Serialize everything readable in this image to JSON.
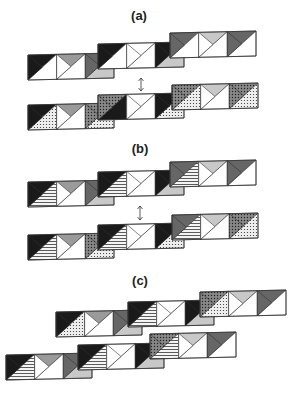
{
  "panels": [
    {
      "id": "a",
      "label": "(a)",
      "label_pos": [
        139,
        8
      ],
      "arrow": {
        "x": 141,
        "y1": 78,
        "y2": 91
      },
      "rows": [
        {
          "segments": [
            {
              "x": 28,
              "y": 55,
              "pattern": [
                "black",
                "white",
                "gray",
                "white",
                "dark",
                "light"
              ]
            },
            {
              "x": 98,
              "y": 44,
              "pattern": [
                "black",
                "white",
                "white",
                "white",
                "black",
                "light"
              ]
            },
            {
              "x": 170,
              "y": 33,
              "pattern": [
                "dark",
                "white",
                "light",
                "white",
                "dark",
                "white"
              ]
            }
          ]
        },
        {
          "segments": [
            {
              "x": 28,
              "y": 105,
              "pattern": [
                "black",
                "dots",
                "gray",
                "white",
                "hatch",
                "dots"
              ]
            },
            {
              "x": 98,
              "y": 95,
              "pattern": [
                "hatch",
                "black",
                "white",
                "white",
                "black",
                "dots"
              ]
            },
            {
              "x": 172,
              "y": 85,
              "pattern": [
                "hatch",
                "dots",
                "light",
                "white",
                "hatch",
                "dots"
              ]
            }
          ]
        }
      ]
    },
    {
      "id": "b",
      "label": "(b)",
      "label_pos": [
        140,
        141
      ],
      "arrow": {
        "x": 140,
        "y1": 206,
        "y2": 220
      },
      "rows": [
        {
          "segments": [
            {
              "x": 28,
              "y": 182,
              "pattern": [
                "black",
                "lines",
                "gray",
                "white",
                "dark",
                "light"
              ]
            },
            {
              "x": 98,
              "y": 172,
              "pattern": [
                "black",
                "lines",
                "white",
                "white",
                "black",
                "light"
              ]
            },
            {
              "x": 170,
              "y": 162,
              "pattern": [
                "dark",
                "lines",
                "light",
                "white",
                "dark",
                "white"
              ]
            }
          ]
        },
        {
          "segments": [
            {
              "x": 28,
              "y": 235,
              "pattern": [
                "black",
                "lines",
                "gray",
                "white",
                "hatch",
                "dots"
              ]
            },
            {
              "x": 98,
              "y": 225,
              "pattern": [
                "black",
                "lines",
                "white",
                "white",
                "black",
                "dots"
              ]
            },
            {
              "x": 172,
              "y": 215,
              "pattern": [
                "dark",
                "lines",
                "light",
                "white",
                "hatch",
                "dots"
              ]
            }
          ]
        }
      ]
    },
    {
      "id": "c",
      "label": "(c)",
      "label_pos": [
        140,
        273
      ],
      "arrow": null,
      "rows": [
        {
          "segments": [
            {
              "x": 56,
              "y": 312,
              "pattern": [
                "black",
                "dots",
                "gray",
                "white",
                "dark",
                "light"
              ]
            },
            {
              "x": 128,
              "y": 302,
              "pattern": [
                "black",
                "lines",
                "white",
                "white",
                "black",
                "light"
              ]
            },
            {
              "x": 200,
              "y": 292,
              "pattern": [
                "hatch",
                "dots",
                "light",
                "white",
                "dark",
                "white"
              ]
            }
          ]
        },
        {
          "segments": [
            {
              "x": 6,
              "y": 355,
              "pattern": [
                "black",
                "lines",
                "gray",
                "white",
                "dark",
                "light"
              ]
            },
            {
              "x": 78,
              "y": 345,
              "pattern": [
                "black",
                "lines",
                "white",
                "white",
                "black",
                "light"
              ]
            },
            {
              "x": 150,
              "y": 334,
              "pattern": [
                "hatch",
                "lines",
                "light",
                "white",
                "dark",
                "white"
              ]
            }
          ]
        }
      ]
    }
  ],
  "colors": {
    "black": "#1a1a1a",
    "dark": "#666666",
    "gray": "#9a9a9a",
    "light": "#c8c8c8",
    "white": "#ffffff",
    "stroke": "#333333"
  }
}
